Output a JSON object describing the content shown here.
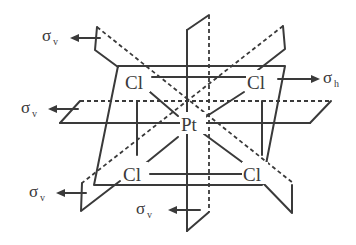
{
  "diagram": {
    "type": "symmetry-elements",
    "atoms": {
      "center": "Pt",
      "ligands": [
        "Cl",
        "Cl",
        "Cl",
        "Cl"
      ]
    },
    "labels": {
      "sigma_v_top_left": {
        "symbol": "σ",
        "subscript": "v"
      },
      "sigma_h_right": {
        "symbol": "σ",
        "subscript": "h"
      },
      "sigma_v_mid_left": {
        "symbol": "σ",
        "subscript": "v"
      },
      "sigma_v_bottom_left": {
        "symbol": "σ",
        "subscript": "v"
      },
      "sigma_v_bottom_center": {
        "symbol": "σ",
        "subscript": "v"
      }
    },
    "colors": {
      "line": "#3a3a3a",
      "background": "#ffffff"
    }
  }
}
